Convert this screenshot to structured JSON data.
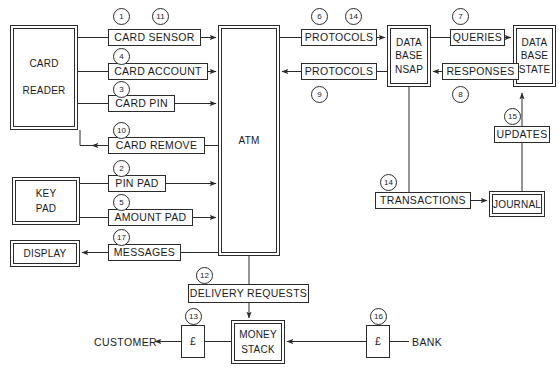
{
  "diagram": {
    "background": "#ffffff",
    "line_color": "#2b2b2b",
    "text_color": "#1a1a1a"
  },
  "nodes": {
    "card_reader": {
      "label": "CARD\n\nREADER",
      "x": 10,
      "y": 25,
      "w": 68,
      "h": 105,
      "style": "double"
    },
    "key_pad": {
      "label": "KEY\nPAD",
      "x": 12,
      "y": 177,
      "w": 68,
      "h": 48,
      "style": "double"
    },
    "display": {
      "label": "DISPLAY",
      "x": 10,
      "y": 240,
      "w": 70,
      "h": 27,
      "style": "double"
    },
    "atm": {
      "label": "ATM",
      "x": 218,
      "y": 25,
      "w": 62,
      "h": 231,
      "style": "double"
    },
    "database_nsap": {
      "label": "DATA\nBASE\nNSAP",
      "x": 387,
      "y": 25,
      "w": 44,
      "h": 62,
      "style": "double"
    },
    "database_state": {
      "label": "DATA\nBASE\nSTATE",
      "x": 513,
      "y": 25,
      "w": 43,
      "h": 62,
      "style": "double"
    },
    "journal": {
      "label": "JOURNAL",
      "x": 489,
      "y": 191,
      "w": 56,
      "h": 26,
      "style": "double"
    },
    "money_stack": {
      "label": "MONEY\nSTACK",
      "x": 231,
      "y": 320,
      "w": 54,
      "h": 44,
      "style": "double"
    }
  },
  "flows": {
    "card_sensor": {
      "label": "CARD SENSOR",
      "x": 108,
      "y": 29,
      "w": 93,
      "h": 17
    },
    "card_account": {
      "label": "CARD ACCOUNT",
      "x": 108,
      "y": 63,
      "w": 100,
      "h": 17
    },
    "card_pin": {
      "label": "CARD PIN",
      "x": 108,
      "y": 95,
      "w": 67,
      "h": 17
    },
    "card_remove": {
      "label": "CARD REMOVE",
      "x": 108,
      "y": 137,
      "w": 97,
      "h": 17
    },
    "pin_pad": {
      "label": "PIN PAD",
      "x": 108,
      "y": 175,
      "w": 58,
      "h": 17
    },
    "amount_pad": {
      "label": "AMOUNT PAD",
      "x": 108,
      "y": 209,
      "w": 85,
      "h": 17
    },
    "messages": {
      "label": "MESSAGES",
      "x": 108,
      "y": 244,
      "w": 73,
      "h": 17
    },
    "protocols_out": {
      "label": "PROTOCOLS",
      "x": 301,
      "y": 29,
      "w": 76,
      "h": 17
    },
    "protocols_in": {
      "label": "PROTOCOLS",
      "x": 301,
      "y": 63,
      "w": 76,
      "h": 17
    },
    "queries": {
      "label": "QUERIES",
      "x": 450,
      "y": 29,
      "w": 55,
      "h": 17
    },
    "responses": {
      "label": "RESPONSES",
      "x": 442,
      "y": 63,
      "w": 77,
      "h": 17
    },
    "updates": {
      "label": "UPDATES",
      "x": 494,
      "y": 126,
      "w": 56,
      "h": 17
    },
    "transactions": {
      "label": "TRANSACTIONS",
      "x": 375,
      "y": 192,
      "w": 96,
      "h": 17
    },
    "delivery_requests": {
      "label": "DELIVERY REQUESTS",
      "x": 188,
      "y": 284,
      "w": 121,
      "h": 19
    },
    "money_customer": {
      "label": "£",
      "x": 181,
      "y": 325,
      "w": 24,
      "h": 33
    },
    "money_bank": {
      "label": "£",
      "x": 366,
      "y": 325,
      "w": 24,
      "h": 33
    }
  },
  "external_labels": {
    "customer": {
      "label": "CUSTOMER",
      "x": 94,
      "y": 336
    },
    "bank": {
      "label": "BANK",
      "x": 412,
      "y": 336
    }
  },
  "tags": [
    {
      "id": "1",
      "num": "1",
      "x": 113,
      "y": 8,
      "for": "card-sensor"
    },
    {
      "id": "11",
      "num": "11",
      "x": 152,
      "y": 8,
      "for": "card-sensor"
    },
    {
      "id": "4",
      "num": "4",
      "x": 113,
      "y": 48,
      "for": "card-account"
    },
    {
      "id": "3",
      "num": "3",
      "x": 113,
      "y": 81,
      "for": "card-pin"
    },
    {
      "id": "10",
      "num": "10",
      "x": 113,
      "y": 122,
      "for": "card-remove"
    },
    {
      "id": "2",
      "num": "2",
      "x": 113,
      "y": 160,
      "for": "pin-pad"
    },
    {
      "id": "5",
      "num": "5",
      "x": 113,
      "y": 194,
      "for": "amount-pad"
    },
    {
      "id": "17",
      "num": "17",
      "x": 113,
      "y": 229,
      "for": "messages"
    },
    {
      "id": "6",
      "num": "6",
      "x": 311,
      "y": 8,
      "for": "protocols-out"
    },
    {
      "id": "14a",
      "num": "14",
      "x": 345,
      "y": 8,
      "for": "protocols-out"
    },
    {
      "id": "9",
      "num": "9",
      "x": 311,
      "y": 86,
      "for": "protocols-in"
    },
    {
      "id": "7",
      "num": "7",
      "x": 452,
      "y": 8,
      "for": "queries"
    },
    {
      "id": "8",
      "num": "8",
      "x": 452,
      "y": 86,
      "for": "responses"
    },
    {
      "id": "15",
      "num": "15",
      "x": 504,
      "y": 108,
      "for": "updates"
    },
    {
      "id": "14b",
      "num": "14",
      "x": 380,
      "y": 174,
      "for": "transactions"
    },
    {
      "id": "12",
      "num": "12",
      "x": 196,
      "y": 267,
      "for": "delivery-requests"
    },
    {
      "id": "13",
      "num": "13",
      "x": 185,
      "y": 308,
      "for": "money-customer"
    },
    {
      "id": "16",
      "num": "16",
      "x": 370,
      "y": 308,
      "for": "money-bank"
    }
  ],
  "connections": [
    {
      "name": "card-reader-to-card-sensor",
      "from": "card_reader",
      "to": "card_sensor"
    },
    {
      "name": "card-sensor-to-atm",
      "from": "card_sensor",
      "to": "atm"
    },
    {
      "name": "card-reader-to-card-account",
      "from": "card_reader",
      "to": "card_account"
    },
    {
      "name": "card-account-to-atm",
      "from": "card_account",
      "to": "atm"
    },
    {
      "name": "card-reader-to-card-pin",
      "from": "card_reader",
      "to": "card_pin"
    },
    {
      "name": "card-pin-to-atm",
      "from": "card_pin",
      "to": "atm"
    },
    {
      "name": "atm-to-card-remove",
      "from": "atm",
      "to": "card_remove"
    },
    {
      "name": "card-remove-to-card-reader",
      "from": "card_remove",
      "to": "card_reader"
    },
    {
      "name": "key-pad-to-pin-pad",
      "from": "key_pad",
      "to": "pin_pad"
    },
    {
      "name": "pin-pad-to-atm",
      "from": "pin_pad",
      "to": "atm"
    },
    {
      "name": "key-pad-to-amount-pad",
      "from": "key_pad",
      "to": "amount_pad"
    },
    {
      "name": "amount-pad-to-atm",
      "from": "amount_pad",
      "to": "atm"
    },
    {
      "name": "atm-to-messages",
      "from": "atm",
      "to": "messages"
    },
    {
      "name": "messages-to-display",
      "from": "messages",
      "to": "display"
    },
    {
      "name": "atm-to-protocols-out",
      "from": "atm",
      "to": "protocols_out"
    },
    {
      "name": "protocols-out-to-database",
      "from": "protocols_out",
      "to": "database_nsap"
    },
    {
      "name": "database-to-protocols-in",
      "from": "database_nsap",
      "to": "protocols_in"
    },
    {
      "name": "protocols-in-to-atm",
      "from": "protocols_in",
      "to": "atm"
    },
    {
      "name": "database-to-queries",
      "from": "database_nsap",
      "to": "queries"
    },
    {
      "name": "queries-to-database-state",
      "from": "queries",
      "to": "database_state"
    },
    {
      "name": "database-state-to-responses",
      "from": "database_state",
      "to": "responses"
    },
    {
      "name": "responses-to-database",
      "from": "responses",
      "to": "database_nsap"
    },
    {
      "name": "journal-to-updates",
      "from": "journal",
      "to": "updates"
    },
    {
      "name": "updates-to-database-state",
      "from": "updates",
      "to": "database_state"
    },
    {
      "name": "database-to-transactions",
      "from": "database_nsap",
      "to": "transactions"
    },
    {
      "name": "transactions-to-journal",
      "from": "transactions",
      "to": "journal"
    },
    {
      "name": "atm-to-delivery-requests",
      "from": "atm",
      "to": "delivery_requests"
    },
    {
      "name": "delivery-requests-to-money",
      "from": "delivery_requests",
      "to": "money_stack"
    },
    {
      "name": "money-stack-to-customer",
      "from": "money_stack",
      "to": "customer"
    },
    {
      "name": "bank-to-money-stack",
      "from": "bank",
      "to": "money_stack"
    }
  ]
}
